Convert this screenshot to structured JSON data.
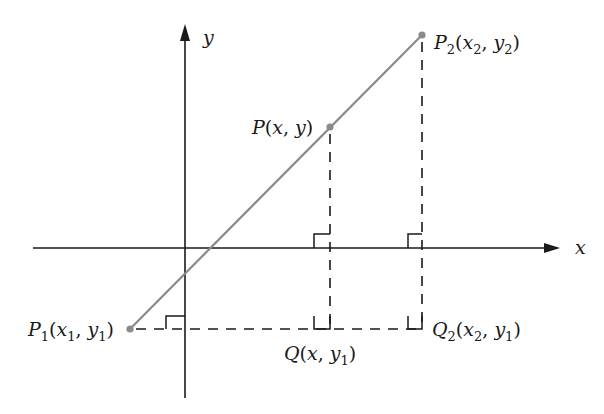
{
  "diagram": {
    "axes": {
      "x_label": "x",
      "y_label": "y"
    },
    "points": {
      "P1": {
        "name": "P",
        "sub": "1",
        "args": [
          "x",
          "1",
          "y",
          "1"
        ],
        "text": "P1(x1, y1)"
      },
      "P": {
        "name": "P",
        "sub": "",
        "args": [
          "x",
          "",
          "y",
          ""
        ],
        "text": "P(x, y)"
      },
      "P2": {
        "name": "P",
        "sub": "2",
        "args": [
          "x",
          "2",
          "y",
          "2"
        ],
        "text": "P2(x2, y2)"
      },
      "Q": {
        "name": "Q",
        "sub": "",
        "args": [
          "x",
          "",
          "y",
          "1"
        ],
        "text": "Q(x, y1)"
      },
      "Q2": {
        "name": "Q",
        "sub": "2",
        "args": [
          "x",
          "2",
          "y",
          "1"
        ],
        "text": "Q2(x2, y1)"
      }
    },
    "colors": {
      "axis": "#1a1a1a",
      "segment": "#8a8a8a",
      "point": "#8a8a8a",
      "dashed": "#1a1a1a"
    },
    "right_angle_markers": 5
  }
}
